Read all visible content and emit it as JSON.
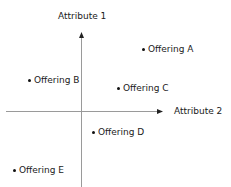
{
  "diagram": {
    "type": "perceptual-map",
    "axes": {
      "vertical": {
        "label": "Attribute 1",
        "x": 81,
        "y_top": 33,
        "y_bottom": 187,
        "arrow": "up"
      },
      "horizontal": {
        "label": "Attribute 2",
        "y": 111,
        "x_left": 6,
        "x_right": 161,
        "arrow": "right"
      }
    },
    "points": [
      {
        "label": "Offering A",
        "x": 143,
        "y": 49
      },
      {
        "label": "Offering B",
        "x": 29,
        "y": 80
      },
      {
        "label": "Offering C",
        "x": 118,
        "y": 88
      },
      {
        "label": "Offering D",
        "x": 93,
        "y": 132
      },
      {
        "label": "Offering E",
        "x": 14,
        "y": 170
      }
    ],
    "colors": {
      "axis": "#9a9a9a",
      "text": "#1a1a1a",
      "dot": "#111111",
      "background": "#ffffff"
    }
  }
}
